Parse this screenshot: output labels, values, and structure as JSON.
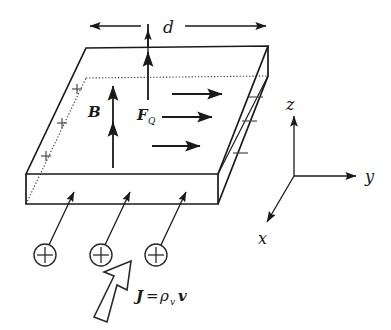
{
  "figure": {
    "labels": {
      "width_dim": "d",
      "magnetic_field": "B",
      "force": "F",
      "force_subscript": "Q",
      "axis_x": "x",
      "axis_y": "y",
      "axis_z": "z"
    },
    "equation": {
      "current_density": "J",
      "equals": "=",
      "charge_density": "ρ",
      "charge_density_subscript": "v",
      "velocity": "v"
    },
    "charge_symbol": "+",
    "positive_sign": "+",
    "negative_sign": "−",
    "counts": {
      "positive_signs": 3,
      "negative_signs": 3,
      "charge_carriers": 3,
      "field_arrows": 3,
      "drift_arrows": 3,
      "current_arrows": 3
    },
    "colors": {
      "ink": "#1a1a1a",
      "hidden_edge": "#3a3a3a",
      "sign": "#4a4a4a",
      "background": "#ffffff"
    }
  }
}
